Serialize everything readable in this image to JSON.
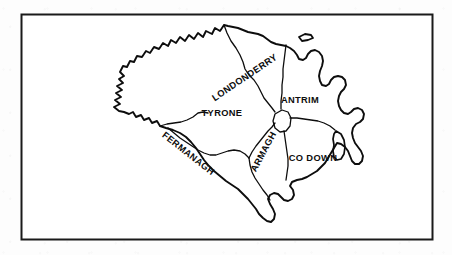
{
  "figure": {
    "kind": "line-drawing-map",
    "region": "Northern Ireland",
    "border": {
      "name": "map-frame",
      "x": 21,
      "y": 14,
      "width": 412,
      "height": 226,
      "stroke_color": "#1a1a1a",
      "stroke_width": 2,
      "fill_color": "#ffffff"
    },
    "background_color": "#fdfdfd",
    "ink_color": "#0d0d0d",
    "outline_stroke_width": 1.9,
    "boundary_stroke_width": 1.3
  },
  "counties": [
    {
      "id": "londonderry",
      "label": "LONDONDERRY",
      "label_x": 245,
      "label_y": 78,
      "label_rotation": -34
    },
    {
      "id": "antrim",
      "label": "ANTRIM",
      "label_x": 300,
      "label_y": 101,
      "label_rotation": 0
    },
    {
      "id": "tyrone",
      "label": "TYRONE",
      "label_x": 222,
      "label_y": 114,
      "label_rotation": 0
    },
    {
      "id": "fermanagh",
      "label": "FERMANAGH",
      "label_x": 188,
      "label_y": 154,
      "label_rotation": 38
    },
    {
      "id": "armagh",
      "label": "ARMAGH",
      "label_x": 264,
      "label_y": 152,
      "label_rotation": -62
    },
    {
      "id": "co-down",
      "label": "CO DOWN",
      "label_x": 313,
      "label_y": 159,
      "label_rotation": 0
    }
  ]
}
